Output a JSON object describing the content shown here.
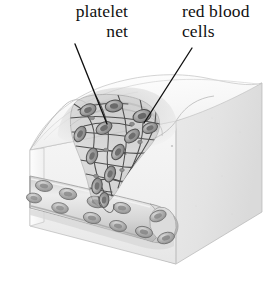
{
  "figure": {
    "background_color": "#ffffff",
    "width": 276,
    "height": 284,
    "labels": {
      "platelet_net": {
        "line1": "platelet",
        "line2": "net",
        "align": "right",
        "color": "#111111"
      },
      "red_blood_cells": {
        "line1": "red blood",
        "line2": "cells",
        "align": "left",
        "color": "#111111"
      }
    },
    "edge_text_fragment": "s",
    "leader_lines": [
      {
        "name": "leader-platelet-net",
        "from_x": 75,
        "from_y": 44,
        "to_x": 107,
        "to_y": 124,
        "color": "#111111"
      },
      {
        "name": "leader-red-blood-cells",
        "from_x": 192,
        "from_y": 48,
        "to_x": 144,
        "to_y": 123,
        "color": "#111111"
      }
    ],
    "illustration": {
      "type": "tissue-block-cutaway",
      "description": "Three dimensional cutaway block of skin tissue shown in pale grey line art. The top surface carries a funnel shaped wound depression filled by a fibrous platelet net. Red blood cells are trapped in the net. A blood vessel runs across the front face of the block and curves around the right corner.",
      "palette": {
        "outline": "#6e6e6e",
        "outline_soft": "#9a9a9a",
        "block_top": "#fbfbfb",
        "block_front": "#f2f2f2",
        "block_side": "#e7e7e7",
        "vessel_fill": "#dcdcdc",
        "vessel_shadow": "#b9b9b9",
        "cell_fill": "#a9a9a9",
        "cell_dark": "#7c7c7c",
        "cell_light": "#d3d3d3",
        "net_stroke": "#585858",
        "wound_shadow": "#cfcfcf"
      },
      "parts": [
        {
          "name": "tissue-block",
          "label": "tissue block"
        },
        {
          "name": "wound-depression",
          "label": "wound depression"
        },
        {
          "name": "platelet-net",
          "label": "platelet net"
        },
        {
          "name": "blood-vessel",
          "label": "blood vessel"
        },
        {
          "name": "red-blood-cell",
          "label": "red blood cell"
        }
      ],
      "vessel_cells_count": 11,
      "net_cells_count": 12
    }
  }
}
